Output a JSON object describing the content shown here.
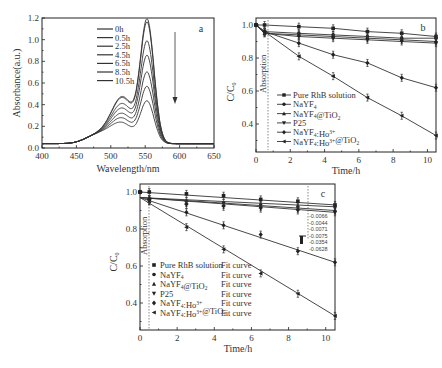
{
  "chart_data": [
    {
      "panel": "a",
      "type": "line",
      "title": "",
      "panel_label": "a",
      "xlabel": "Wavelength/nm",
      "ylabel": "Absorbance(a.u.)",
      "xlim": [
        400,
        650
      ],
      "ylim": [
        0.0,
        1.2
      ],
      "xticks": [
        "400",
        "450",
        "500",
        "550",
        "600",
        "650"
      ],
      "yticks": [
        "0.0",
        "0.2",
        "0.4",
        "0.6",
        "0.8",
        "1.0",
        "1.2"
      ],
      "legend": [
        "0h",
        "0.5h",
        "2.5h",
        "4.5h",
        "6.5h",
        "8.5h",
        "10.5h"
      ],
      "annotation": "downward arrow indicating decreasing absorbance with time",
      "peak_wavelength_nm": 553,
      "series": [
        {
          "name": "0h",
          "peak": 1.12
        },
        {
          "name": "0.5h",
          "peak": 1.09
        },
        {
          "name": "2.5h",
          "peak": 0.92
        },
        {
          "name": "4.5h",
          "peak": 0.79
        },
        {
          "name": "6.5h",
          "peak": 0.64
        },
        {
          "name": "8.5h",
          "peak": 0.51
        },
        {
          "name": "10.5h",
          "peak": 0.38
        }
      ]
    },
    {
      "panel": "b",
      "type": "line",
      "panel_label": "b",
      "xlabel": "Time/h",
      "ylabel": "C/C0",
      "xlim": [
        0,
        10.5
      ],
      "ylim": [
        0.25,
        1.05
      ],
      "xticks": [
        "0",
        "2",
        "4",
        "6",
        "8",
        "10"
      ],
      "yticks": [
        "0.4",
        "0.6",
        "0.8",
        "1.0"
      ],
      "annotation": "Absorption",
      "x": [
        0,
        0.5,
        2.5,
        4.5,
        6.5,
        8.5,
        10.5
      ],
      "series": [
        {
          "name": "Pure RhB solution",
          "marker": "square",
          "values": [
            1.0,
            1.0,
            0.99,
            0.98,
            0.96,
            0.95,
            0.93
          ]
        },
        {
          "name": "NaYF4",
          "marker": "circle",
          "values": [
            1.0,
            0.96,
            0.95,
            0.94,
            0.93,
            0.92,
            0.92
          ]
        },
        {
          "name": "NaYF4@TiO2",
          "marker": "triangle-up",
          "values": [
            1.0,
            0.95,
            0.94,
            0.93,
            0.92,
            0.91,
            0.9
          ]
        },
        {
          "name": "P25",
          "marker": "triangle-down",
          "values": [
            1.0,
            0.95,
            0.93,
            0.92,
            0.91,
            0.9,
            0.89
          ]
        },
        {
          "name": "NaYF4:Ho3+",
          "marker": "diamond",
          "values": [
            1.0,
            0.96,
            0.89,
            0.82,
            0.77,
            0.68,
            0.62
          ]
        },
        {
          "name": "NaYF4:Ho3+@TiO2",
          "marker": "triangle-left",
          "values": [
            1.0,
            0.96,
            0.81,
            0.69,
            0.56,
            0.45,
            0.33
          ]
        }
      ]
    },
    {
      "panel": "c",
      "type": "scatter",
      "panel_label": "c",
      "xlabel": "Time/h",
      "ylabel": "C/C0",
      "xlim": [
        0,
        10.5
      ],
      "ylim": [
        0.25,
        1.05
      ],
      "xticks": [
        "0",
        "2",
        "4",
        "6",
        "8",
        "10"
      ],
      "yticks": [
        "0.4",
        "0.6",
        "0.8",
        "1.0"
      ],
      "annotation": "Absorption",
      "rate_constants": [
        "-0.0066",
        "-0.0044",
        "-0.0071",
        "-0.0075",
        "-0.0354",
        "-0.0628"
      ],
      "x": [
        0,
        0.5,
        2.5,
        4.5,
        6.5,
        8.5,
        10.5
      ],
      "series": [
        {
          "name": "Pure RhB solution",
          "fit_label": "Fit curve",
          "marker": "square",
          "values": [
            1.0,
            1.0,
            0.99,
            0.98,
            0.96,
            0.95,
            0.93
          ]
        },
        {
          "name": "NaYF4",
          "fit_label": "Fit curve",
          "marker": "circle",
          "values": [
            1.0,
            0.96,
            0.95,
            0.94,
            0.93,
            0.92,
            0.92
          ]
        },
        {
          "name": "NaYF4@TiO2",
          "fit_label": "Fit curve",
          "marker": "triangle-up",
          "values": [
            1.0,
            0.95,
            0.94,
            0.93,
            0.92,
            0.91,
            0.9
          ]
        },
        {
          "name": "P25",
          "fit_label": "Fit curve",
          "marker": "triangle-down",
          "values": [
            1.0,
            0.95,
            0.93,
            0.92,
            0.91,
            0.9,
            0.89
          ]
        },
        {
          "name": "NaYF4:Ho3+",
          "fit_label": "Fit curve",
          "marker": "diamond",
          "values": [
            1.0,
            0.96,
            0.89,
            0.82,
            0.77,
            0.68,
            0.62
          ]
        },
        {
          "name": "NaYF4:Ho3+@TiO2",
          "fit_label": "Fit curve",
          "marker": "triangle-left",
          "values": [
            1.0,
            0.96,
            0.81,
            0.69,
            0.56,
            0.45,
            0.33
          ]
        }
      ]
    }
  ],
  "labels": {
    "a": {
      "panel": "a",
      "xlabel": "Wavelength/nm",
      "ylabel": "Absorbance(a.u.)",
      "xticks": [
        "400",
        "450",
        "500",
        "550",
        "600",
        "650"
      ],
      "yticks": [
        "0.0",
        "0.2",
        "0.4",
        "0.6",
        "0.8",
        "1.0",
        "1.2"
      ],
      "legend": [
        "0h",
        "0.5h",
        "2.5h",
        "4.5h",
        "6.5h",
        "8.5h",
        "10.5h"
      ]
    },
    "b": {
      "panel": "b",
      "xlabel": "Time/h",
      "ylabel_main": "C/C",
      "ylabel_sub": "0",
      "absorption": "Absorption",
      "xticks": [
        "0",
        "2",
        "4",
        "6",
        "8",
        "10"
      ],
      "yticks": [
        "0.4",
        "0.6",
        "0.8",
        "1.0"
      ],
      "legend": [
        {
          "main": "Pure RhB solution",
          "sub": "",
          "sup": "",
          "tail": ""
        },
        {
          "main": "NaYF",
          "sub": "4",
          "sup": "",
          "tail": ""
        },
        {
          "main": "NaYF",
          "sub": "4",
          "sup": "",
          "tail": "@TiO",
          "tailsub": "2"
        },
        {
          "main": "P25",
          "sub": "",
          "sup": "",
          "tail": ""
        },
        {
          "main": "NaYF",
          "sub": "4",
          "mid": ":Ho",
          "sup": "3+",
          "tail": ""
        },
        {
          "main": "NaYF",
          "sub": "4",
          "mid": ":Ho",
          "sup": "3+",
          "tail": "@TiO",
          "tailsub": "2"
        }
      ]
    },
    "c": {
      "panel": "c",
      "xlabel": "Time/h",
      "ylabel_main": "C/C",
      "ylabel_sub": "0",
      "absorption": "Absorption",
      "xticks": [
        "0",
        "2",
        "4",
        "6",
        "8",
        "10"
      ],
      "yticks": [
        "0.4",
        "0.6",
        "0.8",
        "1.0"
      ],
      "fit": "Fit curve",
      "k": [
        "-0.0066",
        "-0.0044",
        "-0.0071",
        "-0.0075",
        "-0.0354",
        "-0.0628"
      ]
    }
  }
}
